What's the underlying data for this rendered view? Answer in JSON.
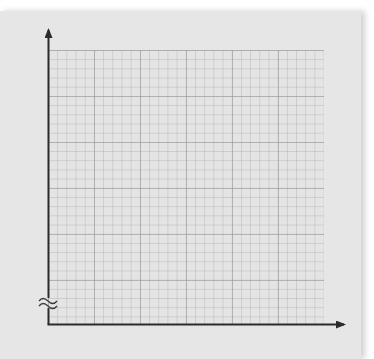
{
  "diagram": {
    "type": "blank-graph-paper-axes",
    "paper_color": "#e6e6e6",
    "grid_color": "#b0b0b0",
    "axis_color": "#333333",
    "grid": {
      "minor_cells_x": 30,
      "minor_cells_y": 30,
      "major_every": 5
    },
    "axes": {
      "x_axis": {
        "label": "",
        "arrow": "right"
      },
      "y_axis": {
        "label": "",
        "arrow": "up",
        "break": true
      }
    },
    "break_symbol": "≈"
  }
}
